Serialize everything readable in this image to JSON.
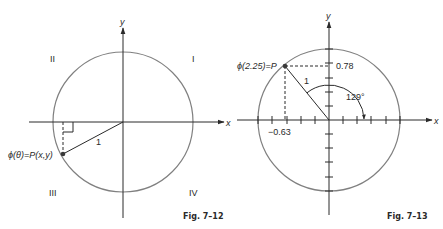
{
  "figures": [
    {
      "id": "fig-7-12",
      "caption": "Fig. 7–12",
      "axis_x_label": "x",
      "axis_y_label": "y",
      "quadrants": {
        "I": "I",
        "II": "II",
        "III": "III",
        "IV": "IV"
      },
      "point_label": "ϕ(θ)=P(x,y)",
      "radius_label": "1",
      "stroke_color": "#3a3a3a",
      "circle_color": "#7a7a7a"
    },
    {
      "id": "fig-7-13",
      "caption": "Fig. 7–13",
      "axis_x_label": "x",
      "axis_y_label": "y",
      "point_label": "ϕ(2.25)=P",
      "radius_label": "1",
      "x_value_label": "−0.63",
      "y_value_label": "0.78",
      "angle_label": "129°",
      "angle_degrees": 129,
      "point_coords": {
        "x": -0.63,
        "y": 0.78
      },
      "tick_count_per_half_axis": 5
    }
  ]
}
